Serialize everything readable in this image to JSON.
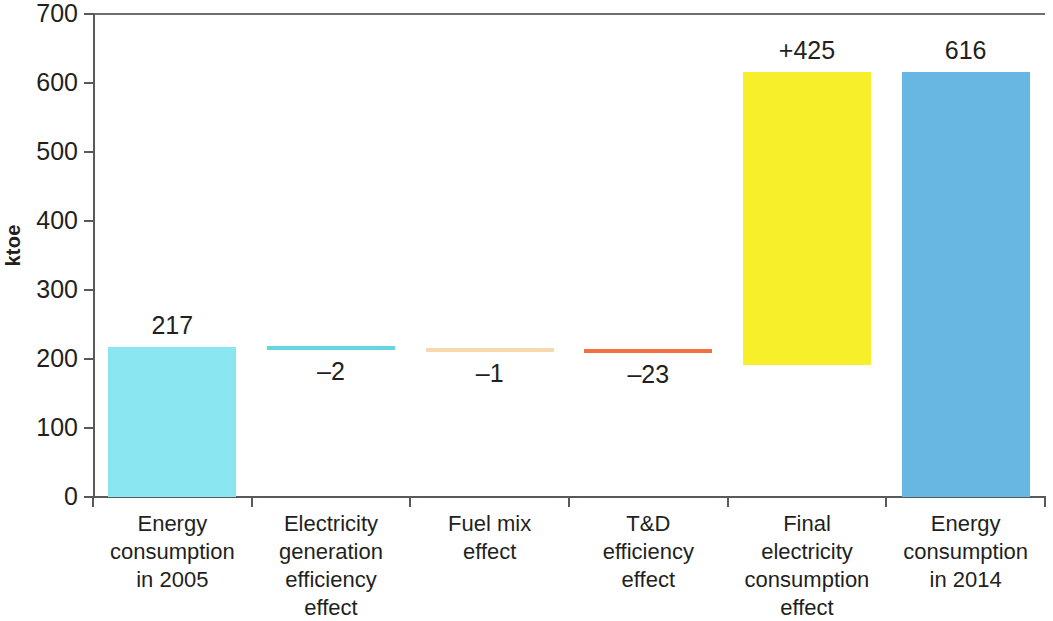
{
  "chart_data": {
    "type": "bar",
    "chart_style": "waterfall",
    "title": "",
    "xlabel": "",
    "ylabel": "ktoe",
    "ylim": [
      0,
      700
    ],
    "ytick_step": 100,
    "ytick_labels": [
      "700",
      "600",
      "500",
      "400",
      "300",
      "200",
      "100",
      "0"
    ],
    "ytick_values": [
      700,
      600,
      500,
      400,
      300,
      200,
      100,
      0
    ],
    "grid": false,
    "legend": "none",
    "categories": [
      "Energy consumption in 2005",
      "Electricity generation efficiency effect",
      "Fuel mix effect",
      "T&D efficiency effect",
      "Final electricity consumption effect",
      "Energy consumption in 2014"
    ],
    "category_lines": [
      [
        "Energy",
        "consumption",
        "in 2005"
      ],
      [
        "Electricity",
        "generation",
        "efficiency",
        "effect"
      ],
      [
        "Fuel mix",
        "effect"
      ],
      [
        "T&D",
        "efficiency",
        "effect"
      ],
      [
        "Final",
        "electricity",
        "consumption",
        "effect"
      ],
      [
        "Energy",
        "consumption",
        "in 2014"
      ]
    ],
    "values": [
      217,
      -2,
      -1,
      -23,
      425,
      616
    ],
    "value_labels": [
      "217",
      "–2",
      "–1",
      "–23",
      "+425",
      "616"
    ],
    "bar_bottoms": [
      0,
      217,
      215,
      214,
      191,
      0
    ],
    "bar_tops": [
      217,
      219,
      216,
      214,
      616,
      616
    ],
    "colors": [
      "#8AE7F2",
      "#63D6DE",
      "#F6D9AE",
      "#F4703F",
      "#F7EF2A",
      "#68B7E2"
    ],
    "axis_color": "#58595b",
    "text_color": "#231f20"
  },
  "bars": [
    {
      "name": "energy-consumption-2005",
      "value_label": "217",
      "cat_lines": [
        "Energy",
        "consumption",
        "in 2005"
      ]
    },
    {
      "name": "electricity-generation-efficiency-effect",
      "value_label": "–2",
      "cat_lines": [
        "Electricity",
        "generation",
        "efficiency",
        "effect"
      ]
    },
    {
      "name": "fuel-mix-effect",
      "value_label": "–1",
      "cat_lines": [
        "Fuel mix",
        "effect"
      ]
    },
    {
      "name": "td-efficiency-effect",
      "value_label": "–23",
      "cat_lines": [
        "T&D",
        "efficiency",
        "effect"
      ]
    },
    {
      "name": "final-electricity-consumption-effect",
      "value_label": "+425",
      "cat_lines": [
        "Final",
        "electricity",
        "consumption",
        "effect"
      ]
    },
    {
      "name": "energy-consumption-2014",
      "value_label": "616",
      "cat_lines": [
        "Energy",
        "consumption",
        "in 2014"
      ]
    }
  ],
  "axis": {
    "y_title": "ktoe",
    "y_labels": [
      "700",
      "600",
      "500",
      "400",
      "300",
      "200",
      "100",
      "0"
    ]
  }
}
